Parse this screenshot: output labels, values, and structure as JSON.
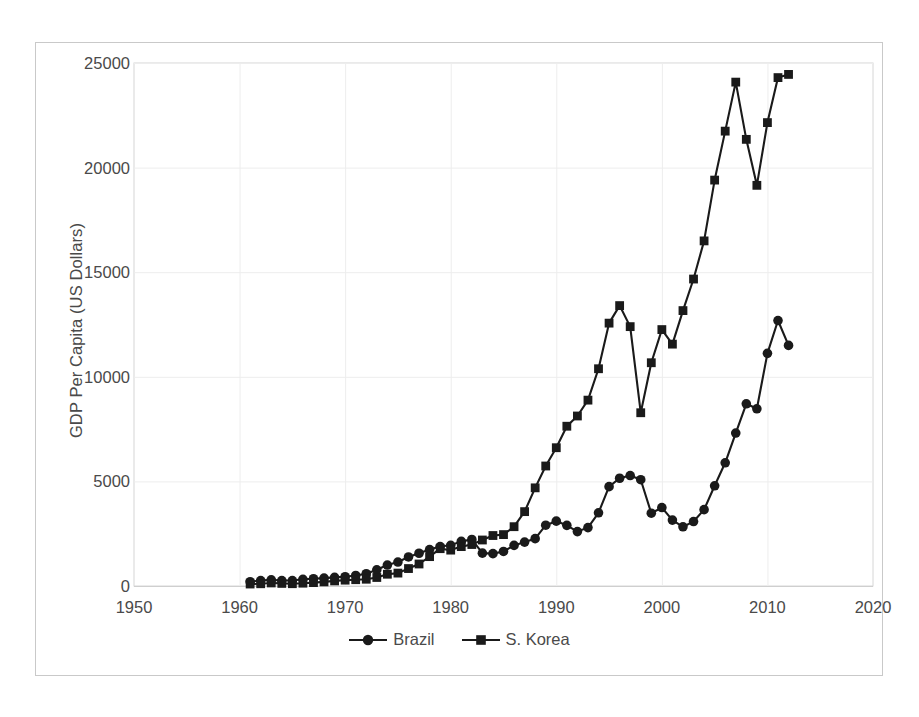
{
  "chart_data": {
    "type": "line",
    "title": "",
    "xlabel": "",
    "ylabel": "GDP Per Capita (US Dollars)",
    "xlim": [
      1950,
      2020
    ],
    "ylim": [
      0,
      25000
    ],
    "xticks": [
      1950,
      1960,
      1970,
      1980,
      1990,
      2000,
      2010,
      2020
    ],
    "yticks": [
      0,
      5000,
      10000,
      15000,
      20000,
      25000
    ],
    "xtick_labels": [
      "1950",
      "1960",
      "1970",
      "1980",
      "1990",
      "2000",
      "2010",
      "2020"
    ],
    "ytick_labels": [
      "0",
      "5000",
      "10000",
      "15000",
      "20000",
      "25000"
    ],
    "grid": "horizontal-and-vertical-faint",
    "legend_position": "bottom-center",
    "line_color": "#1a1a1a",
    "x": [
      1961,
      1962,
      1963,
      1964,
      1965,
      1966,
      1967,
      1968,
      1969,
      1970,
      1971,
      1972,
      1973,
      1974,
      1975,
      1976,
      1977,
      1978,
      1979,
      1980,
      1981,
      1982,
      1983,
      1984,
      1985,
      1986,
      1987,
      1988,
      1989,
      1990,
      1991,
      1992,
      1993,
      1994,
      1995,
      1996,
      1997,
      1998,
      1999,
      2000,
      2001,
      2002,
      2003,
      2004,
      2005,
      2006,
      2007,
      2008,
      2009,
      2010,
      2011,
      2012
    ],
    "series": [
      {
        "name": "Brazil",
        "marker": "circle",
        "color": "#1a1a1a",
        "values": [
          205,
          260,
          292,
          260,
          262,
          320,
          348,
          377,
          414,
          445,
          503,
          586,
          774,
          1003,
          1146,
          1387,
          1566,
          1744,
          1885,
          1947,
          2133,
          2225,
          1570,
          1547,
          1652,
          1941,
          2098,
          2263,
          2906,
          3100,
          2900,
          2600,
          2792,
          3500,
          4750,
          5150,
          5280,
          5080,
          3480,
          3750,
          3150,
          2830,
          3080,
          3650,
          4790,
          5890,
          7310,
          8710,
          8470,
          11120,
          12690,
          11500
        ]
      },
      {
        "name": "S. Korea",
        "marker": "square",
        "color": "#1a1a1a",
        "values": [
          94,
          107,
          146,
          124,
          110,
          135,
          162,
          198,
          243,
          279,
          301,
          324,
          407,
          563,
          617,
          834,
          1052,
          1404,
          1784,
          1715,
          1883,
          1983,
          2199,
          2413,
          2457,
          2835,
          3555,
          4692,
          5736,
          6610,
          7637,
          8126,
          8885,
          10385,
          12565,
          13404,
          12398,
          8282,
          10672,
          12257,
          11561,
          13165,
          14673,
          16496,
          19403,
          21743,
          24086,
          21350,
          19152,
          22151,
          24302,
          24454
        ]
      }
    ]
  },
  "legend": {
    "entries": [
      {
        "label": "Brazil",
        "marker": "circle"
      },
      {
        "label": "S. Korea",
        "marker": "square"
      }
    ]
  }
}
